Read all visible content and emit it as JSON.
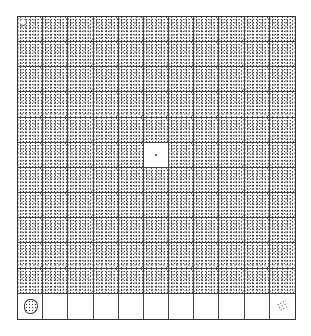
{
  "board": {
    "columns": 11,
    "rows": 12,
    "cell_state_legend": {
      "d": "stippled",
      "e": "empty"
    },
    "grid": [
      "ddddddddddd",
      "ddddddddddd",
      "ddddddddddd",
      "ddddddddddd",
      "ddddddddddd",
      "dddddeddddd",
      "ddddddddddd",
      "ddddddddddd",
      "ddddddddddd",
      "ddddddddddd",
      "ddddddddddd",
      "eeeeeeeeeee"
    ],
    "special_cells": [
      {
        "row": 0,
        "col": 0,
        "icon": "small-circle-icon"
      },
      {
        "row": 5,
        "col": 5,
        "icon": "center-dot-icon"
      },
      {
        "row": 11,
        "col": 0,
        "icon": "stippled-blob-icon"
      },
      {
        "row": 11,
        "col": 10,
        "icon": "scattered-dots-icon"
      }
    ],
    "colors": {
      "line": "#444444",
      "dot": "#3a3a3a",
      "background": "#ffffff"
    }
  }
}
